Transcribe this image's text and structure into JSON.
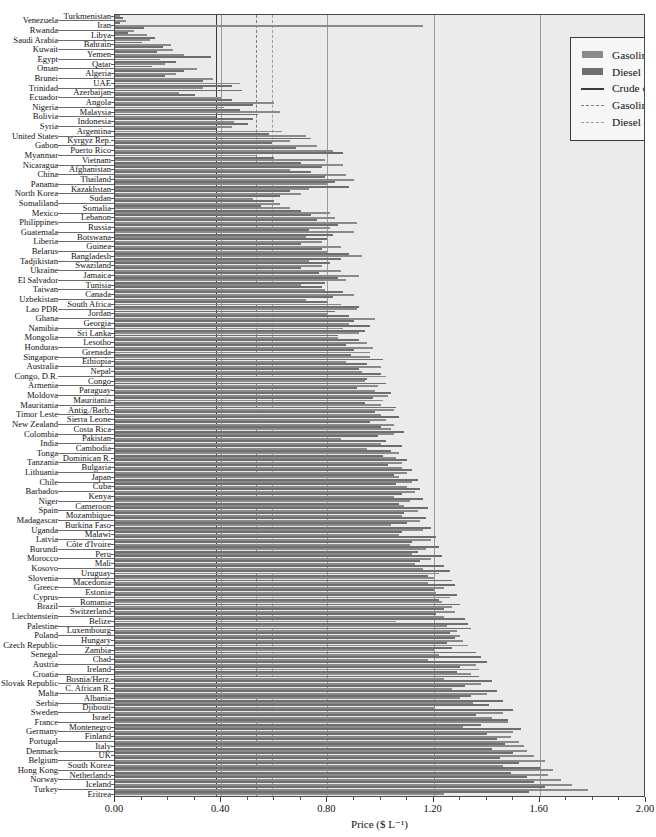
{
  "chart_data": {
    "type": "bar",
    "orientation": "horizontal",
    "title": "",
    "xlabel": "Price ($ L⁻¹)",
    "ylabel": "",
    "xlim": [
      0.0,
      2.0
    ],
    "xticks": [
      "0.00",
      "0.40",
      "0.80",
      "1.20",
      "1.60",
      "2.00"
    ],
    "xtick_values": [
      0.0,
      0.4,
      0.8,
      1.2,
      1.6,
      2.0
    ],
    "grid": true,
    "legend_position": "top-right",
    "legend": [
      {
        "key": "gasoline-swatch",
        "label": "Gasoline",
        "type": "bar",
        "color": "#8a8a8a"
      },
      {
        "key": "diesel-swatch",
        "label": "Diesel",
        "type": "bar",
        "color": "#6e6e6e"
      },
      {
        "key": "crude-line",
        "label": "Crude oil price $0.38 L⁻¹",
        "type": "line-solid",
        "color": "#3a3a3a"
      },
      {
        "key": "gasoline-cost-line",
        "label": "Gasoline cost $0.53 L⁻¹",
        "type": "line-dashed",
        "color": "#7d7d7d"
      },
      {
        "key": "diesel-cost-line",
        "label": "Diesel cost $0.59 L⁻¹",
        "type": "line-dashed",
        "color": "#9c9c9c"
      }
    ],
    "reference_lines": [
      {
        "name": "crude-oil-price",
        "value": 0.38,
        "style": "solid",
        "label": "Crude oil price $0.38 L⁻¹"
      },
      {
        "name": "gasoline-cost",
        "value": 0.53,
        "style": "dashed",
        "label": "Gasoline cost $0.53 L⁻¹"
      },
      {
        "name": "diesel-cost",
        "value": 0.59,
        "style": "dashed",
        "label": "Diesel cost $0.59 L⁻¹"
      }
    ],
    "series": [
      {
        "name": "Gasoline",
        "color": "#8a8a8a"
      },
      {
        "name": "Diesel",
        "color": "#6e6e6e"
      }
    ],
    "categories": [
      "Turkmenistan",
      "Venezuela",
      "Iran",
      "Rwanda",
      "Libya",
      "Saudi Arabia",
      "Bahrain",
      "Kuwait",
      "Yemen",
      "Egypt",
      "Qatar",
      "Oman",
      "Algeria",
      "Brunei",
      "UAE",
      "Trinidad",
      "Azerbaijan",
      "Ecuador",
      "Angola",
      "Nigeria",
      "Malaysia",
      "Bolivia",
      "Indonesia",
      "Syria",
      "Argentina",
      "United States",
      "Kyrgyz Rep.",
      "Gabon",
      "Puerto Rico",
      "Myanmar",
      "Vietnam",
      "Nicaragua",
      "Afghanistan",
      "China",
      "Thailand",
      "Panama",
      "Kazakhstan",
      "North Korea",
      "Sudan",
      "Somaliland",
      "Somalia",
      "Mexico",
      "Lebanon",
      "Philippines",
      "Russia",
      "Guatemala",
      "Botswana",
      "Liberia",
      "Guinea",
      "Belarus",
      "Bangladesh",
      "Tadjikistan",
      "Swaziland",
      "Ukraine",
      "Jamaica",
      "El Salvador",
      "Tunisia",
      "Taiwan",
      "Canada",
      "Uzbekistan",
      "South Africa",
      "Lao PDR",
      "Jordan",
      "Ghana",
      "Georgia",
      "Namibia",
      "Sri Lanka",
      "Mongolia",
      "Lesotho",
      "Honduras",
      "Grenada",
      "Singapore",
      "Ethiopia",
      "Australia",
      "Nepal",
      "Congo, D.R.",
      "Congo",
      "Armenia",
      "Paraguay",
      "Moldova",
      "Mauritania",
      "Mauritania2",
      "Antig./Barb.",
      "Timor Leste",
      "Sierra Leone",
      "New Zealand",
      "Costa Rica",
      "Colombia",
      "Pakistan",
      "India",
      "Cambodia",
      "Tonga",
      "Dominican R.",
      "Tanzania",
      "Bulgaria",
      "Lithuania",
      "Japan",
      "Chile",
      "Cuba",
      "Barbados",
      "Kenya",
      "Niger",
      "Cameroon",
      "Spain",
      "Mozambique",
      "Madagascar",
      "Burkina Faso",
      "Uganda",
      "Malawi",
      "Latvia",
      "Côte d'Ivoire",
      "Burundi",
      "Peru",
      "Morocco",
      "Mali",
      "Kosovo",
      "Uruguay",
      "Slovenia",
      "Macedonia",
      "Greece",
      "Estonia",
      "Cyprus",
      "Romania",
      "Brazil",
      "Switzerland",
      "Liechtenstein",
      "Belize",
      "Palestine",
      "Luxembourg",
      "Poland",
      "Hungary",
      "Czech Republic",
      "Zambia",
      "Senegal",
      "Chad",
      "Austria",
      "Ireland",
      "Croatia",
      "Bosnia/Herz.",
      "Slovak Republic",
      "C. African R.",
      "Malta",
      "Albania",
      "Serbia",
      "Djibouti",
      "Sweden",
      "Israel",
      "France",
      "Montenegro",
      "Germany",
      "Finland",
      "Portugal",
      "Italy",
      "Denmark",
      "UK",
      "Belgium",
      "South Korea",
      "Hong Kong",
      "Netherlands",
      "Norway",
      "Iceland",
      "Turkey",
      "Eritrea"
    ],
    "left_labels": [
      {
        "index": 1,
        "label": "Venezuela"
      },
      {
        "index": 3,
        "label": "Rwanda"
      },
      {
        "index": 5,
        "label": "Saudi Arabia"
      },
      {
        "index": 7,
        "label": "Kuwait"
      },
      {
        "index": 9,
        "label": "Egypt"
      },
      {
        "index": 11,
        "label": "Oman"
      },
      {
        "index": 13,
        "label": "Brunei"
      },
      {
        "index": 15,
        "label": "Trinidad"
      },
      {
        "index": 17,
        "label": "Ecuador"
      },
      {
        "index": 19,
        "label": "Nigeria"
      },
      {
        "index": 21,
        "label": "Bolivia"
      },
      {
        "index": 23,
        "label": "Syria"
      },
      {
        "index": 25,
        "label": "United States"
      },
      {
        "index": 27,
        "label": "Gabon"
      },
      {
        "index": 29,
        "label": "Myanmar"
      },
      {
        "index": 31,
        "label": "Nicaragua"
      },
      {
        "index": 33,
        "label": "China"
      },
      {
        "index": 35,
        "label": "Panama"
      },
      {
        "index": 37,
        "label": "North Korea"
      },
      {
        "index": 39,
        "label": "Somaliland"
      },
      {
        "index": 41,
        "label": "Mexico"
      },
      {
        "index": 43,
        "label": "Philippines"
      },
      {
        "index": 45,
        "label": "Guatemala"
      },
      {
        "index": 47,
        "label": "Liberia"
      },
      {
        "index": 49,
        "label": "Belarus"
      },
      {
        "index": 51,
        "label": "Tadjikistan"
      },
      {
        "index": 53,
        "label": "Ukraine"
      },
      {
        "index": 55,
        "label": "El Salvador"
      },
      {
        "index": 57,
        "label": "Taiwan"
      },
      {
        "index": 59,
        "label": "Uzbekistan"
      },
      {
        "index": 61,
        "label": "Lao PDR"
      },
      {
        "index": 63,
        "label": "Ghana"
      },
      {
        "index": 65,
        "label": "Namibia"
      },
      {
        "index": 67,
        "label": "Mongolia"
      },
      {
        "index": 69,
        "label": "Honduras"
      },
      {
        "index": 71,
        "label": "Singapore"
      },
      {
        "index": 73,
        "label": "Australia"
      },
      {
        "index": 75,
        "label": "Congo, D.R."
      },
      {
        "index": 77,
        "label": "Armenia"
      },
      {
        "index": 79,
        "label": "Moldova"
      },
      {
        "index": 81,
        "label": "Mauritania"
      },
      {
        "index": 83,
        "label": "Timor Leste"
      },
      {
        "index": 85,
        "label": "New Zealand"
      },
      {
        "index": 87,
        "label": "Colombia"
      },
      {
        "index": 89,
        "label": "India"
      },
      {
        "index": 91,
        "label": "Tonga"
      },
      {
        "index": 93,
        "label": "Tanzania"
      },
      {
        "index": 95,
        "label": "Lithuania"
      },
      {
        "index": 97,
        "label": "Chile"
      },
      {
        "index": 99,
        "label": "Barbados"
      },
      {
        "index": 101,
        "label": "Niger"
      },
      {
        "index": 103,
        "label": "Spain"
      },
      {
        "index": 105,
        "label": "Madagascar"
      },
      {
        "index": 107,
        "label": "Uganda"
      },
      {
        "index": 109,
        "label": "Latvia"
      },
      {
        "index": 111,
        "label": "Burundi"
      },
      {
        "index": 113,
        "label": "Morocco"
      },
      {
        "index": 115,
        "label": "Kosovo"
      },
      {
        "index": 117,
        "label": "Slovenia"
      },
      {
        "index": 119,
        "label": "Greece"
      },
      {
        "index": 121,
        "label": "Cyprus"
      },
      {
        "index": 123,
        "label": "Brazil"
      },
      {
        "index": 125,
        "label": "Liechtenstein"
      },
      {
        "index": 127,
        "label": "Palestine"
      },
      {
        "index": 129,
        "label": "Poland"
      },
      {
        "index": 131,
        "label": "Czech Republic"
      },
      {
        "index": 133,
        "label": "Senegal"
      },
      {
        "index": 135,
        "label": "Austria"
      },
      {
        "index": 137,
        "label": "Croatia"
      },
      {
        "index": 139,
        "label": "Slovak Republic"
      },
      {
        "index": 141,
        "label": "Malta"
      },
      {
        "index": 143,
        "label": "Serbia"
      },
      {
        "index": 145,
        "label": "Sweden"
      },
      {
        "index": 147,
        "label": "France"
      },
      {
        "index": 149,
        "label": "Germany"
      },
      {
        "index": 151,
        "label": "Portugal"
      },
      {
        "index": 153,
        "label": "Denmark"
      },
      {
        "index": 155,
        "label": "Belgium"
      },
      {
        "index": 157,
        "label": "Hong Kong"
      },
      {
        "index": 159,
        "label": "Norway"
      },
      {
        "index": 161,
        "label": "Turkey"
      }
    ],
    "inner_labels": [
      {
        "index": 0,
        "label": "Turkmenistan"
      },
      {
        "index": 2,
        "label": "Iran"
      },
      {
        "index": 4,
        "label": "Libya"
      },
      {
        "index": 6,
        "label": "Bahrain"
      },
      {
        "index": 8,
        "label": "Yemen"
      },
      {
        "index": 10,
        "label": "Qatar"
      },
      {
        "index": 12,
        "label": "Algeria"
      },
      {
        "index": 14,
        "label": "UAE"
      },
      {
        "index": 16,
        "label": "Azerbaijan"
      },
      {
        "index": 18,
        "label": "Angola"
      },
      {
        "index": 20,
        "label": "Malaysia"
      },
      {
        "index": 22,
        "label": "Indonesia"
      },
      {
        "index": 24,
        "label": "Argentina"
      },
      {
        "index": 26,
        "label": "Kyrgyz Rep."
      },
      {
        "index": 28,
        "label": "Puerto Rico"
      },
      {
        "index": 30,
        "label": "Vietnam"
      },
      {
        "index": 32,
        "label": "Afghanistan"
      },
      {
        "index": 34,
        "label": "Thailand"
      },
      {
        "index": 36,
        "label": "Kazakhstan"
      },
      {
        "index": 38,
        "label": "Sudan"
      },
      {
        "index": 40,
        "label": "Somalia"
      },
      {
        "index": 42,
        "label": "Lebanon"
      },
      {
        "index": 44,
        "label": "Russia"
      },
      {
        "index": 46,
        "label": "Botswana"
      },
      {
        "index": 48,
        "label": "Guinea"
      },
      {
        "index": 50,
        "label": "Bangladesh"
      },
      {
        "index": 52,
        "label": "Swaziland"
      },
      {
        "index": 54,
        "label": "Jamaica"
      },
      {
        "index": 56,
        "label": "Tunisia"
      },
      {
        "index": 58,
        "label": "Canada"
      },
      {
        "index": 60,
        "label": "South Africa"
      },
      {
        "index": 62,
        "label": "Jordan"
      },
      {
        "index": 64,
        "label": "Georgia"
      },
      {
        "index": 66,
        "label": "Sri Lanka"
      },
      {
        "index": 68,
        "label": "Lesotho"
      },
      {
        "index": 70,
        "label": "Grenada"
      },
      {
        "index": 72,
        "label": "Ethiopia"
      },
      {
        "index": 74,
        "label": "Nepal"
      },
      {
        "index": 76,
        "label": "Congo"
      },
      {
        "index": 78,
        "label": "Paraguay"
      },
      {
        "index": 80,
        "label": "Mauritania"
      },
      {
        "index": 82,
        "label": "Antig./Barb."
      },
      {
        "index": 84,
        "label": "Sierra Leone"
      },
      {
        "index": 86,
        "label": "Costa Rica"
      },
      {
        "index": 88,
        "label": "Pakistan"
      },
      {
        "index": 90,
        "label": "Cambodia"
      },
      {
        "index": 92,
        "label": "Dominican R."
      },
      {
        "index": 94,
        "label": "Bulgaria"
      },
      {
        "index": 96,
        "label": "Japan"
      },
      {
        "index": 98,
        "label": "Cuba"
      },
      {
        "index": 100,
        "label": "Kenya"
      },
      {
        "index": 102,
        "label": "Cameroon"
      },
      {
        "index": 104,
        "label": "Mozambique"
      },
      {
        "index": 106,
        "label": "Burkina Faso"
      },
      {
        "index": 108,
        "label": "Malawi"
      },
      {
        "index": 110,
        "label": "Côte d'Ivoire"
      },
      {
        "index": 112,
        "label": "Peru"
      },
      {
        "index": 114,
        "label": "Mali"
      },
      {
        "index": 116,
        "label": "Uruguay"
      },
      {
        "index": 118,
        "label": "Macedonia"
      },
      {
        "index": 120,
        "label": "Estonia"
      },
      {
        "index": 122,
        "label": "Romania"
      },
      {
        "index": 124,
        "label": "Switzerland"
      },
      {
        "index": 126,
        "label": "Belize"
      },
      {
        "index": 128,
        "label": "Luxembourg"
      },
      {
        "index": 130,
        "label": "Hungary"
      },
      {
        "index": 132,
        "label": "Zambia"
      },
      {
        "index": 134,
        "label": "Chad"
      },
      {
        "index": 136,
        "label": "Ireland"
      },
      {
        "index": 138,
        "label": "Bosnia/Herz."
      },
      {
        "index": 140,
        "label": "C. African R."
      },
      {
        "index": 142,
        "label": "Albania"
      },
      {
        "index": 144,
        "label": "Djibouti"
      },
      {
        "index": 146,
        "label": "Israel"
      },
      {
        "index": 148,
        "label": "Montenegro"
      },
      {
        "index": 150,
        "label": "Finland"
      },
      {
        "index": 152,
        "label": "Italy"
      },
      {
        "index": 154,
        "label": "UK"
      },
      {
        "index": 156,
        "label": "South Korea"
      },
      {
        "index": 158,
        "label": "Netherlands"
      },
      {
        "index": 160,
        "label": "Iceland"
      },
      {
        "index": 162,
        "label": "Eritrea"
      }
    ],
    "gasoline": [
      0.02,
      0.04,
      1.16,
      0.07,
      0.12,
      0.13,
      0.21,
      0.22,
      0.26,
      0.17,
      0.19,
      0.31,
      0.23,
      0.37,
      0.47,
      0.33,
      0.24,
      0.4,
      0.6,
      0.41,
      0.62,
      0.38,
      0.45,
      0.44,
      0.63,
      0.72,
      0.66,
      0.76,
      0.82,
      0.53,
      0.79,
      0.86,
      0.66,
      0.87,
      0.9,
      0.8,
      0.73,
      0.7,
      0.52,
      0.62,
      0.66,
      0.81,
      0.83,
      0.91,
      0.81,
      0.9,
      0.72,
      0.78,
      0.85,
      0.8,
      0.93,
      0.73,
      0.78,
      0.85,
      0.92,
      0.87,
      0.7,
      0.79,
      0.9,
      0.72,
      0.85,
      0.91,
      0.8,
      0.98,
      0.88,
      0.86,
      0.92,
      0.84,
      0.95,
      0.97,
      0.96,
      0.96,
      0.87,
      1.0,
      0.93,
      1.02,
      0.94,
      0.99,
      0.98,
      1.03,
      1.01,
      1.0,
      1.05,
      1.0,
      1.02,
      1.05,
      1.04,
      1.05,
      0.85,
      1.0,
      0.95,
      1.07,
      1.06,
      1.08,
      1.08,
      1.1,
      1.07,
      1.12,
      1.1,
      1.13,
      1.05,
      1.11,
      1.09,
      1.14,
      1.08,
      1.15,
      1.04,
      1.16,
      1.07,
      1.19,
      1.11,
      1.17,
      1.12,
      1.19,
      1.13,
      1.16,
      1.22,
      1.2,
      1.18,
      1.24,
      1.21,
      1.26,
      1.23,
      1.27,
      1.28,
      1.24,
      1.06,
      1.25,
      1.29,
      1.3,
      1.31,
      1.33,
      1.2,
      1.22,
      1.18,
      1.36,
      1.37,
      1.34,
      1.24,
      1.38,
      1.27,
      1.4,
      1.3,
      1.35,
      1.2,
      1.46,
      1.42,
      1.48,
      1.31,
      1.5,
      1.49,
      1.52,
      1.54,
      1.55,
      1.58,
      1.62,
      1.46,
      1.65,
      1.63,
      1.68,
      1.72,
      1.78,
      1.24
    ],
    "diesel": [
      0.03,
      0.02,
      0.11,
      0.05,
      0.15,
      0.1,
      0.18,
      0.16,
      0.36,
      0.23,
      0.14,
      0.26,
      0.19,
      0.33,
      0.44,
      0.48,
      0.3,
      0.44,
      0.52,
      0.47,
      0.54,
      0.52,
      0.5,
      0.38,
      0.58,
      0.74,
      0.59,
      0.68,
      0.86,
      0.6,
      0.7,
      0.78,
      0.74,
      0.79,
      0.83,
      0.88,
      0.66,
      0.62,
      0.6,
      0.55,
      0.7,
      0.74,
      0.76,
      0.84,
      0.73,
      0.82,
      0.8,
      0.7,
      0.78,
      0.88,
      0.85,
      0.81,
      0.7,
      0.77,
      0.84,
      0.79,
      0.78,
      0.86,
      0.82,
      0.8,
      0.92,
      0.83,
      0.88,
      0.9,
      0.96,
      0.94,
      0.84,
      0.92,
      0.87,
      0.9,
      0.89,
      1.01,
      0.95,
      0.92,
      1.0,
      0.95,
      1.02,
      0.91,
      1.04,
      0.97,
      0.94,
      1.06,
      0.98,
      1.07,
      0.96,
      1.0,
      1.09,
      0.99,
      1.02,
      1.08,
      1.04,
      1.01,
      1.1,
      1.03,
      1.12,
      1.05,
      1.14,
      1.06,
      1.15,
      1.08,
      1.16,
      1.07,
      1.18,
      1.09,
      1.17,
      1.1,
      1.19,
      1.08,
      1.21,
      1.12,
      1.22,
      1.14,
      1.23,
      1.15,
      1.24,
      1.26,
      1.18,
      1.27,
      1.28,
      1.2,
      1.29,
      1.22,
      1.3,
      1.24,
      1.21,
      1.32,
      1.33,
      1.34,
      1.26,
      1.28,
      1.25,
      1.27,
      1.36,
      1.38,
      1.4,
      1.3,
      1.29,
      1.37,
      1.42,
      1.32,
      1.44,
      1.34,
      1.46,
      1.41,
      1.5,
      1.36,
      1.48,
      1.38,
      1.53,
      1.4,
      1.44,
      1.47,
      1.42,
      1.5,
      1.45,
      1.52,
      1.6,
      1.49,
      1.55,
      1.58,
      1.62,
      1.56,
      1.88
    ]
  }
}
